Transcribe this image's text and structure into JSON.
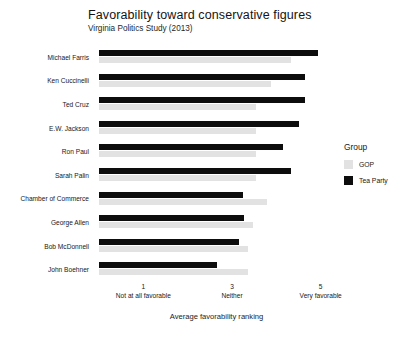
{
  "chart_data": {
    "type": "bar",
    "orientation": "horizontal",
    "title": "Favorability toward conservative figures",
    "subtitle": "Virginia Politics Study (2013)",
    "xlabel": "Average favorability ranking",
    "ylabel": "",
    "xlim": [
      0,
      5.3
    ],
    "grid": false,
    "legend_position": "right",
    "legend_title": "Group",
    "categories": [
      "Michael Farris",
      "Ken Cuccinelli",
      "Ted Cruz",
      "E.W. Jackson",
      "Ron Paul",
      "Sarah Palin",
      "Chamber of Commerce",
      "George Allen",
      "Bob McDonnell",
      "John Boehner"
    ],
    "series": [
      {
        "name": "Tea Party",
        "color": "#0d0d0d",
        "values": [
          4.95,
          4.65,
          4.65,
          4.52,
          4.15,
          4.33,
          3.24,
          3.28,
          3.15,
          2.67
        ]
      },
      {
        "name": "GOP",
        "color": "#e2e2e2",
        "values": [
          4.33,
          3.87,
          3.54,
          3.54,
          3.54,
          3.54,
          3.78,
          3.48,
          3.35,
          3.35
        ]
      }
    ],
    "xticks": [
      {
        "value": 1,
        "num": "1",
        "sub": "Not at all favorable"
      },
      {
        "value": 3,
        "num": "3",
        "sub": "Neither"
      },
      {
        "value": 5,
        "num": "5",
        "sub": "Very favorable"
      }
    ]
  }
}
